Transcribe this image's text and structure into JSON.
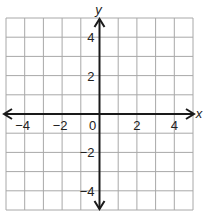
{
  "chart_data": {
    "type": "coordinate-grid",
    "title": "",
    "xlabel": "x",
    "ylabel": "y",
    "xlim": [
      -5,
      5
    ],
    "ylim": [
      -5,
      5
    ],
    "grid": true,
    "grid_step": 1,
    "x_tick_labels": [
      "-4",
      "-2",
      "2",
      "4"
    ],
    "x_ticks": [
      -4,
      -2,
      2,
      4
    ],
    "y_tick_labels": [
      "4",
      "2",
      "-2",
      "-4"
    ],
    "y_ticks": [
      4,
      2,
      -2,
      -4
    ],
    "origin_label": "0",
    "axes_arrows": true,
    "series": []
  },
  "colors": {
    "grid": "#a8a8a8",
    "axis": "#1a1a1a",
    "text": "#222222",
    "background": "#ffffff"
  }
}
